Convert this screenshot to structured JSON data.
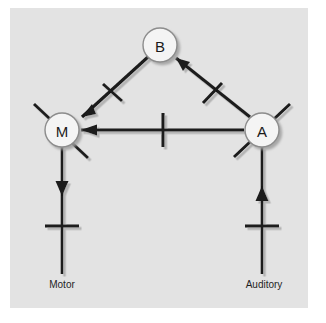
{
  "figure": {
    "kind": "neural-circuit-diagram",
    "background_color": "#ffffff",
    "panel_color": "#e3e3e3",
    "line_color": "#1a1a1a",
    "shadow_color": "#b5b5b5",
    "node_fill": "#f4f4f4",
    "node_stroke": "#8c8c8c"
  },
  "nodes": [
    {
      "id": "B",
      "label": "B",
      "cx": 160,
      "cy": 45,
      "r": 17
    },
    {
      "id": "M",
      "label": "M",
      "cx": 62,
      "cy": 130,
      "r": 17
    },
    {
      "id": "A",
      "label": "A",
      "cx": 262,
      "cy": 130,
      "r": 17
    }
  ],
  "edges": [
    {
      "id": "b-to-m",
      "from": "B",
      "to": "M",
      "arrow": "toward-M",
      "marker": "tick"
    },
    {
      "id": "a-to-b",
      "from": "A",
      "to": "B",
      "arrow": "toward-B",
      "marker": "tick"
    },
    {
      "id": "a-to-m",
      "from": "A",
      "to": "M",
      "arrow": "toward-M",
      "marker": "tick"
    },
    {
      "id": "m-to-motor",
      "from": "M",
      "to": "Motor",
      "arrow": "toward-Motor",
      "marker": "tick"
    },
    {
      "id": "auditory-to-a",
      "from": "Auditory",
      "to": "A",
      "arrow": "toward-A",
      "marker": "tick"
    }
  ],
  "io_labels": {
    "motor": "Motor",
    "auditory": "Auditory"
  },
  "icon_names": {
    "arrowhead": "arrowhead-icon",
    "synapse_tick": "synapse-tick-icon",
    "dendrite_spoke": "dendrite-spoke-icon"
  }
}
